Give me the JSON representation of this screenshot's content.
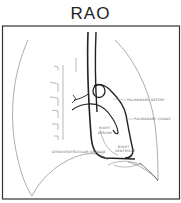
{
  "title": "RAO",
  "labels": {
    "pulmonary_artery": "PULMONARY ARTERY",
    "pulmonary_conus": "PULMONARY CONUS",
    "right_atrium_1": "RIGHT",
    "right_atrium_2": "ATRIUM",
    "right_ventricle_1": "RIGHT",
    "right_ventricle_2": "VENTRICLE",
    "av_groove": "ATRIOVENTRICULAR GROOVE"
  },
  "colors": {
    "line": "#222222",
    "thin_line": "#777777",
    "background": "#ffffff"
  }
}
